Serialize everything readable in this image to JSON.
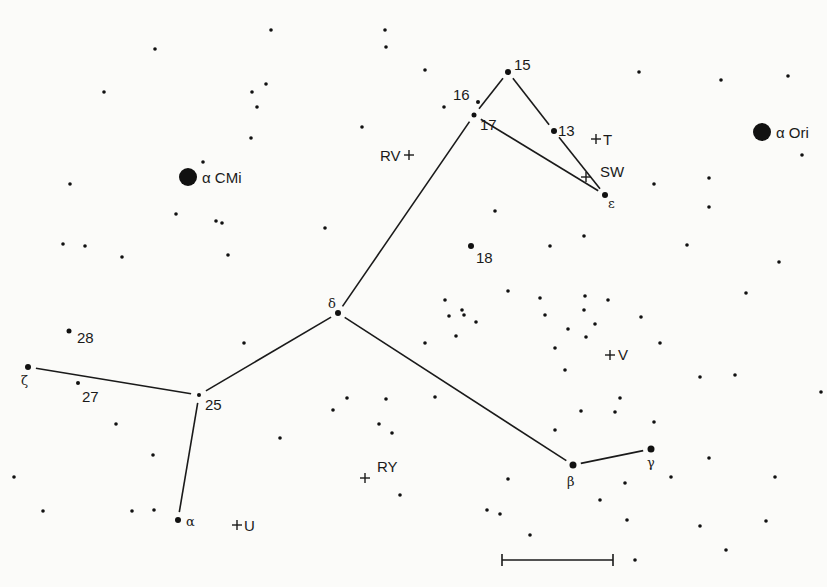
{
  "chart_data": {
    "type": "scatter",
    "title": "",
    "bright_stars": [
      {
        "name": "alpha-CMi",
        "label": "α CMi",
        "x": 188,
        "y": 177,
        "r": 9
      },
      {
        "name": "alpha-Ori",
        "label": "α Ori",
        "x": 762,
        "y": 132,
        "r": 9
      }
    ],
    "labeled_stars": [
      {
        "name": "15",
        "label": "15",
        "x": 508,
        "y": 72,
        "r": 3,
        "lx": 514,
        "ly": 70
      },
      {
        "name": "16",
        "label": "16",
        "x": 478,
        "y": 102,
        "r": 2,
        "lx": 453,
        "ly": 100
      },
      {
        "name": "17",
        "label": "17",
        "x": 474,
        "y": 115,
        "r": 2.5,
        "lx": 480,
        "ly": 130
      },
      {
        "name": "13",
        "label": "13",
        "x": 554,
        "y": 131,
        "r": 3,
        "lx": 558,
        "ly": 136
      },
      {
        "name": "epsilon",
        "label": "ε",
        "x": 605,
        "y": 195,
        "r": 3,
        "lx": 608,
        "ly": 208
      },
      {
        "name": "18",
        "label": "18",
        "x": 471,
        "y": 246,
        "r": 3,
        "lx": 476,
        "ly": 263
      },
      {
        "name": "delta",
        "label": "δ",
        "x": 338,
        "y": 313,
        "r": 3,
        "lx": 328,
        "ly": 308
      },
      {
        "name": "25",
        "label": "25",
        "x": 199,
        "y": 395,
        "r": 2,
        "lx": 205,
        "ly": 410
      },
      {
        "name": "zeta",
        "label": "ζ",
        "x": 28,
        "y": 367,
        "r": 3,
        "lx": 21,
        "ly": 385
      },
      {
        "name": "28",
        "label": "28",
        "x": 69,
        "y": 331,
        "r": 2.5,
        "lx": 77,
        "ly": 343
      },
      {
        "name": "27",
        "label": "27",
        "x": 78,
        "y": 383,
        "r": 2,
        "lx": 82,
        "ly": 402
      },
      {
        "name": "alpha",
        "label": "α",
        "x": 178,
        "y": 520,
        "r": 3,
        "lx": 186,
        "ly": 526
      },
      {
        "name": "beta",
        "label": "β",
        "x": 573,
        "y": 465,
        "r": 3.5,
        "lx": 567,
        "ly": 486
      },
      {
        "name": "gamma",
        "label": "γ",
        "x": 651,
        "y": 449,
        "r": 3.5,
        "lx": 647,
        "ly": 467
      }
    ],
    "variable_stars": [
      {
        "name": "RV",
        "label": "RV",
        "x": 409,
        "y": 155,
        "lx": 380,
        "ly": 161,
        "label_side": "left"
      },
      {
        "name": "T",
        "label": "T",
        "x": 596,
        "y": 139,
        "lx": 603,
        "ly": 145,
        "label_side": "right"
      },
      {
        "name": "SW",
        "label": "SW",
        "x": 586,
        "y": 177,
        "lx": 600,
        "ly": 177,
        "label_side": "right-up"
      },
      {
        "name": "V",
        "label": "V",
        "x": 610,
        "y": 355,
        "lx": 618,
        "ly": 360,
        "label_side": "right"
      },
      {
        "name": "RY",
        "label": "RY",
        "x": 365,
        "y": 478,
        "lx": 377,
        "ly": 472,
        "label_side": "right-up"
      },
      {
        "name": "U",
        "label": "U",
        "x": 237,
        "y": 525,
        "lx": 244,
        "ly": 531,
        "label_side": "right"
      }
    ],
    "constellation_lines": [
      {
        "from": "15",
        "to": "17"
      },
      {
        "from": "15",
        "to": "13"
      },
      {
        "from": "13",
        "to": "epsilon"
      },
      {
        "from": "17",
        "to": "epsilon"
      },
      {
        "from": "17",
        "to": "delta"
      },
      {
        "from": "delta",
        "to": "25"
      },
      {
        "from": "delta",
        "to": "beta"
      },
      {
        "from": "beta",
        "to": "gamma"
      },
      {
        "from": "25",
        "to": "zeta"
      },
      {
        "from": "25",
        "to": "alpha"
      }
    ],
    "field_stars": [
      [
        155,
        49
      ],
      [
        271,
        30
      ],
      [
        104,
        92
      ],
      [
        252,
        92
      ],
      [
        266,
        84
      ],
      [
        257,
        107
      ],
      [
        251,
        138
      ],
      [
        203,
        162
      ],
      [
        70,
        184
      ],
      [
        176,
        214
      ],
      [
        216,
        221
      ],
      [
        222,
        223
      ],
      [
        228,
        255
      ],
      [
        122,
        257
      ],
      [
        85,
        246
      ],
      [
        63,
        244
      ],
      [
        325,
        228
      ],
      [
        385,
        30
      ],
      [
        386,
        47
      ],
      [
        362,
        127
      ],
      [
        425,
        70
      ],
      [
        444,
        107
      ],
      [
        495,
        211
      ],
      [
        639,
        72
      ],
      [
        721,
        80
      ],
      [
        788,
        76
      ],
      [
        802,
        155
      ],
      [
        709,
        178
      ],
      [
        709,
        207
      ],
      [
        654,
        184
      ],
      [
        584,
        236
      ],
      [
        687,
        245
      ],
      [
        779,
        262
      ],
      [
        550,
        246
      ],
      [
        508,
        291
      ],
      [
        540,
        298
      ],
      [
        608,
        300
      ],
      [
        568,
        329
      ],
      [
        585,
        296
      ],
      [
        584,
        310
      ],
      [
        595,
        324
      ],
      [
        641,
        317
      ],
      [
        586,
        337
      ],
      [
        746,
        293
      ],
      [
        425,
        343
      ],
      [
        464,
        315
      ],
      [
        449,
        316
      ],
      [
        456,
        336
      ],
      [
        555,
        348
      ],
      [
        660,
        343
      ],
      [
        700,
        377
      ],
      [
        620,
        398
      ],
      [
        565,
        370
      ],
      [
        581,
        411
      ],
      [
        555,
        430
      ],
      [
        654,
        422
      ],
      [
        615,
        412
      ],
      [
        671,
        477
      ],
      [
        709,
        458
      ],
      [
        625,
        483
      ],
      [
        600,
        500
      ],
      [
        627,
        520
      ],
      [
        508,
        479
      ],
      [
        530,
        535
      ],
      [
        487,
        510
      ],
      [
        500,
        514
      ],
      [
        635,
        560
      ],
      [
        700,
        526
      ],
      [
        726,
        550
      ],
      [
        775,
        477
      ],
      [
        766,
        521
      ],
      [
        821,
        392
      ],
      [
        735,
        375
      ],
      [
        244,
        343
      ],
      [
        347,
        398
      ],
      [
        386,
        399
      ],
      [
        379,
        424
      ],
      [
        392,
        433
      ],
      [
        280,
        438
      ],
      [
        400,
        495
      ],
      [
        154,
        510
      ],
      [
        132,
        511
      ],
      [
        43,
        511
      ],
      [
        116,
        424
      ],
      [
        153,
        455
      ],
      [
        14,
        477
      ],
      [
        333,
        410
      ],
      [
        476,
        322
      ],
      [
        435,
        397
      ],
      [
        462,
        310
      ],
      [
        445,
        300
      ],
      [
        545,
        315
      ]
    ],
    "scale_bar": {
      "x1": 502,
      "x2": 613,
      "y": 560,
      "tick_height": 12
    },
    "axes": {
      "xlabel": "",
      "ylabel": "",
      "grid": false,
      "legend": false
    }
  }
}
